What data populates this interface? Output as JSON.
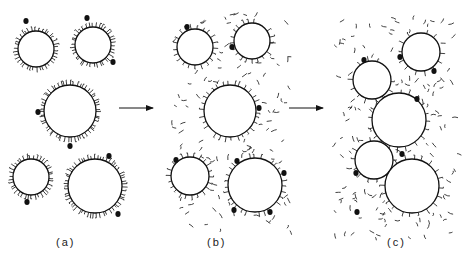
{
  "figure": {
    "panels": [
      {
        "id": "a",
        "label": "(a)",
        "label_pos": [
          62,
          246
        ],
        "hair_density": 1.0,
        "free_fragments": 0,
        "circles": [
          {
            "cx": 36,
            "cy": 49,
            "r": 18,
            "dots": [
              [
                -10,
                -28
              ]
            ]
          },
          {
            "cx": 93,
            "cy": 45,
            "r": 18,
            "dots": [
              [
                -6,
                -27
              ],
              [
                20,
                17
              ]
            ]
          },
          {
            "cx": 70,
            "cy": 111,
            "r": 26,
            "dots": [
              [
                -32,
                1
              ],
              [
                0,
                35
              ]
            ]
          },
          {
            "cx": 31,
            "cy": 177,
            "r": 18,
            "dots": [
              [
                -4,
                25
              ]
            ]
          },
          {
            "cx": 95,
            "cy": 186,
            "r": 27,
            "dots": [
              [
                14,
                -30
              ],
              [
                23,
                28
              ]
            ]
          }
        ]
      },
      {
        "id": "b",
        "label": "(b)",
        "label_pos": [
          213,
          246
        ],
        "hair_density": 0.55,
        "free_fragments": 95,
        "frag_region": [
          172,
          12,
          290,
          232
        ],
        "circles": [
          {
            "cx": 195,
            "cy": 47,
            "r": 18,
            "dots": [
              [
                -8,
                -20
              ]
            ]
          },
          {
            "cx": 252,
            "cy": 41,
            "r": 18,
            "dots": [
              [
                -20,
                6
              ]
            ]
          },
          {
            "cx": 230,
            "cy": 111,
            "r": 26,
            "dots": [
              [
                29,
                -3
              ]
            ]
          },
          {
            "cx": 190,
            "cy": 176,
            "r": 19,
            "dots": [
              [
                -14,
                -16
              ]
            ]
          },
          {
            "cx": 255,
            "cy": 185,
            "r": 27,
            "dots": [
              [
                -18,
                -24
              ],
              [
                29,
                -12
              ],
              [
                -21,
                25
              ],
              [
                15,
                27
              ]
            ]
          }
        ]
      },
      {
        "id": "c",
        "label": "(c)",
        "label_pos": [
          393,
          246
        ],
        "hair_density": 0.35,
        "free_fragments": 120,
        "frag_region": [
          333,
          15,
          458,
          238
        ],
        "circles": [
          {
            "cx": 372,
            "cy": 80,
            "r": 19,
            "dots": [
              [
                -8,
                -20
              ]
            ]
          },
          {
            "cx": 421,
            "cy": 52,
            "r": 19,
            "dots": [
              [
                -21,
                5
              ],
              [
                13,
                19
              ]
            ]
          },
          {
            "cx": 399,
            "cy": 120,
            "r": 27,
            "dots": [
              [
                18,
                -21
              ]
            ]
          },
          {
            "cx": 374,
            "cy": 160,
            "r": 19,
            "dots": [
              [
                -18,
                13
              ]
            ]
          },
          {
            "cx": 412,
            "cy": 186,
            "r": 27,
            "dots": [
              [
                -10,
                -32
              ]
            ]
          }
        ],
        "loose_dots": [
          [
            357,
            212
          ]
        ]
      }
    ],
    "arrows": [
      {
        "x1": 119,
        "y1": 108,
        "x2": 153,
        "y2": 108
      },
      {
        "x1": 289,
        "y1": 108,
        "x2": 323,
        "y2": 108
      }
    ],
    "colors": {
      "ink": "#111111",
      "background": "#ffffff"
    }
  }
}
